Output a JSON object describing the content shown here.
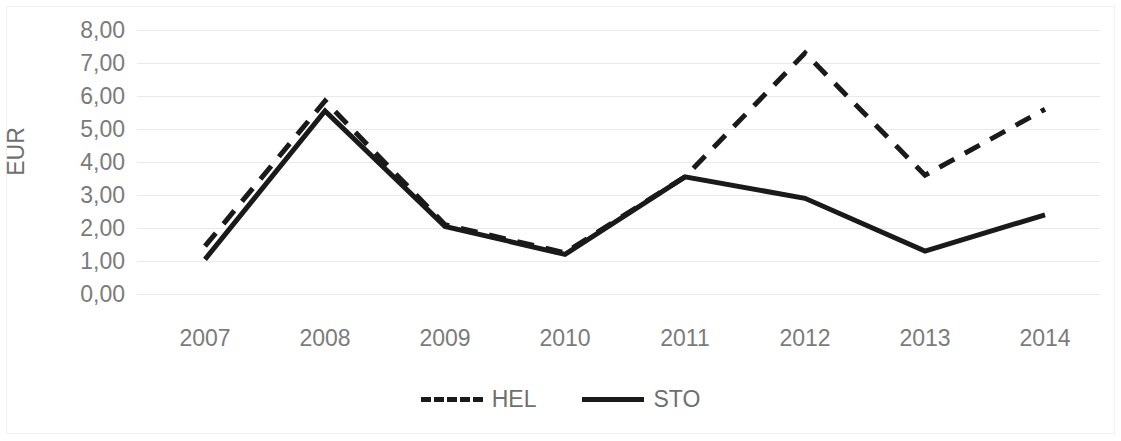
{
  "chart_data": {
    "type": "line",
    "title": "",
    "xlabel": "",
    "ylabel": "EUR",
    "categories": [
      "2007",
      "2008",
      "2009",
      "2010",
      "2011",
      "2012",
      "2013",
      "2014"
    ],
    "ylim": [
      0,
      8
    ],
    "ytick_labels": [
      "8,00",
      "7,00",
      "6,00",
      "5,00",
      "4,00",
      "3,00",
      "2,00",
      "1,00",
      "0,00"
    ],
    "ytick_values": [
      8,
      7,
      6,
      5,
      4,
      3,
      2,
      1,
      0
    ],
    "grid": true,
    "legend_position": "bottom",
    "decimal_separator": ",",
    "series": [
      {
        "name": "HEL",
        "style": "dashed",
        "color": "#1a1a1a",
        "values": [
          1.45,
          5.85,
          2.1,
          1.25,
          3.55,
          7.3,
          3.6,
          5.6
        ]
      },
      {
        "name": "STO",
        "style": "solid",
        "color": "#1a1a1a",
        "values": [
          1.05,
          5.55,
          2.05,
          1.2,
          3.55,
          2.9,
          1.3,
          2.4
        ]
      }
    ]
  },
  "legend": {
    "items": [
      {
        "label": "HEL"
      },
      {
        "label": "STO"
      }
    ]
  }
}
